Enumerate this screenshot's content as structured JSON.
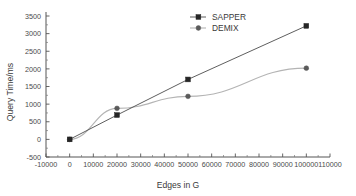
{
  "chart_data": {
    "type": "line",
    "title": "",
    "xlabel": "Edges in G",
    "ylabel": "Query Time/ms",
    "xlim": [
      -10000,
      110000
    ],
    "ylim": [
      -500,
      3500
    ],
    "xticks": [
      -10000,
      0,
      10000,
      20000,
      30000,
      40000,
      50000,
      60000,
      70000,
      80000,
      90000,
      100000,
      110000
    ],
    "xtick_labels": [
      "-10000",
      "0",
      "10000",
      "20000",
      "30000",
      "40000",
      "50000",
      "60000",
      "70000",
      "80000",
      "90000",
      "100000",
      "110000"
    ],
    "yticks": [
      -500,
      0,
      500,
      1000,
      1500,
      2000,
      2500,
      3000,
      3500
    ],
    "ytick_labels": [
      "-500",
      "0",
      "500",
      "1000",
      "1500",
      "2000",
      "2500",
      "3000",
      "3500"
    ],
    "grid": false,
    "legend_position": "top-center",
    "x": [
      0,
      20000,
      50000,
      100000
    ],
    "series": [
      {
        "name": "SAPPER",
        "marker": "square",
        "color": "#262626",
        "values": [
          0,
          690,
          1700,
          3220
        ]
      },
      {
        "name": "DEMIX",
        "marker": "circle",
        "color": "#5a5a5a",
        "values": [
          0,
          880,
          1220,
          2020
        ]
      }
    ]
  },
  "legend": {
    "entries": [
      {
        "label": "SAPPER",
        "marker": "square-marker-icon"
      },
      {
        "label": "DEMIX",
        "marker": "circle-marker-icon"
      }
    ]
  },
  "axes": {
    "x_title": "Edges in G",
    "y_title": "Query Time/ms"
  },
  "colors": {
    "sapper": "#262626",
    "demix": "#5a5a5a",
    "axis": "#555555",
    "background": "#ffffff"
  }
}
